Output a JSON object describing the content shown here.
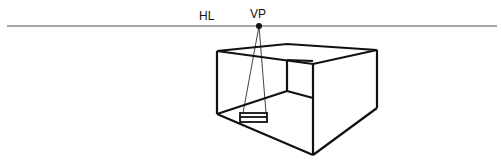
{
  "diagram": {
    "type": "one-point-perspective",
    "labels": {
      "horizon": "HL",
      "vanishing_point": "VP"
    },
    "colors": {
      "ink": "#111111",
      "horizon_line": "#888888",
      "background": "#ffffff"
    },
    "horizon_line": {
      "x1": 7,
      "x2": 497,
      "y": 26
    },
    "vanishing_point": {
      "x": 259,
      "y": 26
    },
    "room_box": {
      "top_left": [
        217,
        51
      ],
      "top_back": [
        287,
        44
      ],
      "top_right": [
        377,
        50
      ],
      "front_top": [
        313,
        64
      ],
      "front_bottom": [
        313,
        155
      ],
      "bottom_right": [
        377,
        108
      ],
      "bottom_left": [
        217,
        114
      ],
      "back_wall_top": [
        287,
        60
      ],
      "back_wall_bottom": [
        287,
        91
      ],
      "back_floor_right": [
        313,
        98
      ]
    },
    "rug": {
      "front_left": [
        240,
        122
      ],
      "front_right": [
        267,
        122
      ],
      "top_left": [
        240,
        113
      ],
      "top_right": [
        267,
        113
      ],
      "mid_y": 117
    },
    "sight_lines": [
      {
        "from": [
          259,
          26
        ],
        "to": [
          243,
          113
        ]
      },
      {
        "from": [
          259,
          26
        ],
        "to": [
          266,
          113
        ]
      }
    ]
  }
}
